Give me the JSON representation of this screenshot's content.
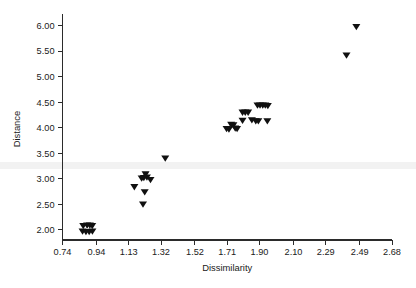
{
  "chart_data": {
    "type": "scatter",
    "title": "",
    "xlabel": "Dissimilarity",
    "ylabel": "Distance",
    "xlim": [
      0.74,
      2.68
    ],
    "ylim": [
      1.8,
      6.15
    ],
    "grid": false,
    "legend": null,
    "marker": "triangle-down",
    "marker_color": "#101010",
    "xticks": [
      0.74,
      0.94,
      1.13,
      1.32,
      1.52,
      1.71,
      1.9,
      2.1,
      2.29,
      2.49,
      2.68
    ],
    "xticklabels": [
      "0.74",
      "0.94",
      "1.13",
      "1.32",
      "1.52",
      "1.71",
      "1.90",
      "2.10",
      "2.29",
      "2.49",
      "2.68"
    ],
    "yticks": [
      2.0,
      2.5,
      3.0,
      3.5,
      4.0,
      4.5,
      5.0,
      5.5,
      6.0
    ],
    "yticklabels": [
      "2.00",
      "2.50",
      "3.00",
      "3.50",
      "4.00",
      "4.50",
      "5.00",
      "5.50",
      "6.00"
    ],
    "points": [
      {
        "x": 0.862,
        "y": 2.08
      },
      {
        "x": 0.885,
        "y": 2.09
      },
      {
        "x": 0.901,
        "y": 2.09
      },
      {
        "x": 0.915,
        "y": 2.08
      },
      {
        "x": 0.858,
        "y": 1.97
      },
      {
        "x": 0.878,
        "y": 1.96
      },
      {
        "x": 0.897,
        "y": 1.96
      },
      {
        "x": 0.916,
        "y": 1.97
      },
      {
        "x": 1.163,
        "y": 2.84
      },
      {
        "x": 1.206,
        "y": 3.01
      },
      {
        "x": 1.219,
        "y": 3.02
      },
      {
        "x": 1.229,
        "y": 3.09
      },
      {
        "x": 1.237,
        "y": 3.03
      },
      {
        "x": 1.258,
        "y": 2.98
      },
      {
        "x": 1.224,
        "y": 2.74
      },
      {
        "x": 1.214,
        "y": 2.5
      },
      {
        "x": 1.345,
        "y": 3.4
      },
      {
        "x": 1.706,
        "y": 3.98
      },
      {
        "x": 1.72,
        "y": 3.97
      },
      {
        "x": 1.733,
        "y": 4.06
      },
      {
        "x": 1.746,
        "y": 4.05
      },
      {
        "x": 1.757,
        "y": 3.99
      },
      {
        "x": 1.768,
        "y": 3.98
      },
      {
        "x": 1.8,
        "y": 4.3
      },
      {
        "x": 1.816,
        "y": 4.3
      },
      {
        "x": 1.833,
        "y": 4.3
      },
      {
        "x": 1.8,
        "y": 4.14
      },
      {
        "x": 1.855,
        "y": 4.15
      },
      {
        "x": 1.878,
        "y": 4.13
      },
      {
        "x": 1.893,
        "y": 4.13
      },
      {
        "x": 1.888,
        "y": 4.44
      },
      {
        "x": 1.903,
        "y": 4.44
      },
      {
        "x": 1.919,
        "y": 4.44
      },
      {
        "x": 1.934,
        "y": 4.44
      },
      {
        "x": 1.949,
        "y": 4.43
      },
      {
        "x": 1.946,
        "y": 4.13
      },
      {
        "x": 2.412,
        "y": 5.42
      },
      {
        "x": 2.47,
        "y": 5.98
      }
    ]
  }
}
